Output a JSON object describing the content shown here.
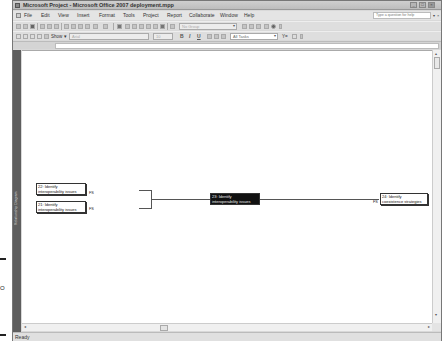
{
  "window": {
    "title": "Microsoft Project - Microsoft Office 2007 deployment.mpp",
    "controls": [
      "minimize",
      "restore",
      "close"
    ]
  },
  "menubar": {
    "items": [
      "File",
      "Edit",
      "View",
      "Insert",
      "Format",
      "Tools",
      "Project",
      "Report",
      "Collaborate",
      "Window",
      "Help"
    ],
    "help_placeholder": "Type a question for help",
    "doc_controls": [
      "▾",
      "×"
    ]
  },
  "toolbar_standard": {
    "group_combo": "No Group",
    "group_arrow": "▾"
  },
  "toolbar_formatting": {
    "show_label": "Show ▾",
    "font_combo": "Arial",
    "size_combo": "10",
    "bold": "B",
    "italic": "I",
    "underline": "U",
    "filter_combo": "All Tasks",
    "filter_arrow": "▾",
    "autofilter": "Y="
  },
  "view_bar": {
    "label": "Relationship Diagram"
  },
  "diagram": {
    "predecessors": [
      {
        "id": "22",
        "label_line1": "22: Identify",
        "label_line2": "interoperability issues",
        "link": "FS"
      },
      {
        "id": "21",
        "label_line1": "21: Identify",
        "label_line2": "interoperability issues",
        "link": "FS"
      }
    ],
    "selected": {
      "id": "23",
      "label_line1": "23: Identify",
      "label_line2": "interoperability issues"
    },
    "successors": [
      {
        "id": "24",
        "label_line1": "24: Identify",
        "label_line2": "coexistence strategies",
        "link": "FS"
      }
    ]
  },
  "scrollbars": {
    "up": "▴",
    "down": "▾",
    "left": "◂",
    "right": "▸"
  },
  "statusbar": {
    "status": "Ready"
  },
  "margin": {
    "o_mark": "O"
  }
}
